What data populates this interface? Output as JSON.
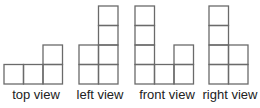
{
  "diagram": {
    "cell_size": 19.5,
    "baseline_y": 84,
    "stroke_color": "#6a6a6a",
    "views": [
      {
        "name": "top-view",
        "label": "top view",
        "x": 4,
        "columns": [
          1,
          1,
          2
        ],
        "label_x": 36
      },
      {
        "name": "left-view",
        "label": "left view",
        "x": 79,
        "columns": [
          2,
          4
        ],
        "label_x": 100
      },
      {
        "name": "front-view",
        "label": "front view",
        "x": 135,
        "columns": [
          4,
          1,
          2
        ],
        "label_x": 167
      },
      {
        "name": "right-view",
        "label": "right view",
        "x": 209,
        "columns": [
          4,
          2
        ],
        "label_x": 230
      }
    ]
  }
}
